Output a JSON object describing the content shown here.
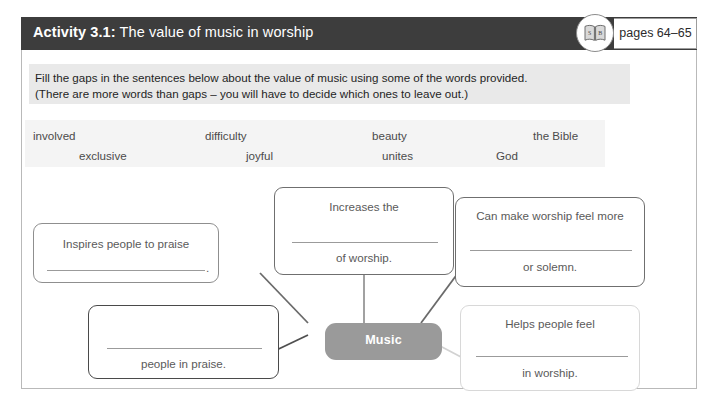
{
  "header": {
    "activity_label": "Activity 3.1:",
    "title": "The value of music in worship",
    "book_icon": "open-book-icon",
    "pages": "pages 64–65",
    "bar_color": "#3d3d3d"
  },
  "instructions": {
    "line1": "Fill the gaps in the sentences below about the value of music using some of the words provided.",
    "line2": "(There are more words than gaps – you will have to decide which ones to leave out.)",
    "background": "#e9e9e9"
  },
  "word_bank": {
    "background": "#f4f4f4",
    "row1": [
      "involved",
      "difficulty",
      "beauty",
      "the Bible"
    ],
    "row2": [
      "exclusive",
      "joyful",
      "unites",
      "God"
    ]
  },
  "mind_map": {
    "center": {
      "label": "Music",
      "fill": "#9a9a9a",
      "text_color": "#ffffff"
    },
    "nodes": [
      {
        "id": "top-center",
        "text_above": "Increases the",
        "text_below": "of worship.",
        "trailing_period": "",
        "border": "#6f6f6f"
      },
      {
        "id": "top-right",
        "text_above": "Can make worship feel more",
        "text_below": "or solemn.",
        "trailing_period": "",
        "border": "#6f6f6f"
      },
      {
        "id": "left",
        "text_above": "Inspires people to praise",
        "text_below": "",
        "trailing_period": ".",
        "border": "#8f8f8f"
      },
      {
        "id": "bottom-left",
        "text_above": "",
        "text_below": "people in praise.",
        "trailing_period": "",
        "border": "#4a4a4a"
      },
      {
        "id": "bottom-right",
        "text_above": "Helps people feel",
        "text_below": "in worship.",
        "trailing_period": "",
        "border": "#d8d8d8"
      }
    ]
  }
}
